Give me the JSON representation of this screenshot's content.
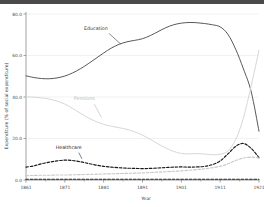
{
  "chart_data": {
    "type": "line",
    "title": "",
    "xlabel": "Year",
    "ylabel": "Expenditure (% of social expenditure)",
    "xlim": [
      1861,
      1921
    ],
    "ylim": [
      0.0,
      80.0
    ],
    "grid": true,
    "legend_position": "inline-annotations",
    "xticks": [
      "1861",
      "1871",
      "1881",
      "1891",
      "1901",
      "1911",
      "1921"
    ],
    "xtick_values": [
      1861,
      1871,
      1881,
      1891,
      1901,
      1911,
      1921
    ],
    "yticks": [
      "0.0",
      "20.0",
      "40.0",
      "60.0",
      "80.0"
    ],
    "ytick_values": [
      0.0,
      20.0,
      40.0,
      60.0,
      80.0
    ],
    "x": [
      1861,
      1863,
      1865,
      1867,
      1869,
      1871,
      1873,
      1875,
      1877,
      1879,
      1881,
      1883,
      1885,
      1887,
      1889,
      1891,
      1893,
      1895,
      1897,
      1899,
      1901,
      1903,
      1905,
      1907,
      1909,
      1911,
      1913,
      1915,
      1917,
      1919,
      1921
    ],
    "series": [
      {
        "name": "Education",
        "color": "#4f4f4f",
        "style": "solid",
        "label_x": 1879,
        "label_y": 72.5,
        "values": [
          50.2,
          49.4,
          48.9,
          48.8,
          49.2,
          50.1,
          51.6,
          53.6,
          56.0,
          58.6,
          61.2,
          63.6,
          65.4,
          66.6,
          67.3,
          68.1,
          69.6,
          71.5,
          73.4,
          74.8,
          75.6,
          75.9,
          75.8,
          75.4,
          74.8,
          73.8,
          70.2,
          63.0,
          53.5,
          42.5,
          23.5
        ]
      },
      {
        "name": "Pensions",
        "color": "#d4d4d4",
        "style": "solid",
        "label_x": 1876,
        "label_y": 38.5,
        "values": [
          40.1,
          39.9,
          39.6,
          39.0,
          38.0,
          36.6,
          34.5,
          32.2,
          30.0,
          28.2,
          26.8,
          25.9,
          25.2,
          24.4,
          23.2,
          21.6,
          19.6,
          17.4,
          15.4,
          13.8,
          12.8,
          12.6,
          12.7,
          12.5,
          12.2,
          12.4,
          14.0,
          19.5,
          30.0,
          45.5,
          62.5
        ]
      },
      {
        "name": "Healthcare",
        "color": "#1a1a1a",
        "style": "dashed",
        "label_x": 1872,
        "label_y": 15.0,
        "values": [
          6.2,
          6.8,
          7.8,
          8.6,
          9.2,
          9.6,
          9.4,
          8.8,
          8.0,
          7.2,
          6.6,
          6.2,
          5.9,
          5.7,
          5.6,
          5.5,
          5.6,
          5.8,
          6.0,
          6.2,
          6.3,
          6.2,
          6.3,
          6.6,
          7.4,
          9.2,
          12.6,
          16.2,
          17.6,
          15.2,
          10.8
        ]
      },
      {
        "name": "Other",
        "color": "#c9c9c9",
        "style": "dashed",
        "label_x": null,
        "label_y": null,
        "values": [
          2.1,
          2.2,
          2.3,
          2.3,
          2.4,
          2.4,
          2.5,
          2.6,
          2.7,
          2.8,
          2.9,
          3.0,
          3.1,
          3.2,
          3.3,
          3.4,
          3.6,
          3.8,
          4.0,
          4.2,
          4.4,
          4.7,
          5.0,
          5.4,
          5.9,
          6.6,
          7.8,
          9.4,
          10.6,
          11.0,
          10.6
        ]
      },
      {
        "name": "Baseline",
        "color": "#1f1f1f",
        "style": "dashed",
        "label_x": null,
        "label_y": null,
        "values": [
          0.35,
          0.35,
          0.35,
          0.35,
          0.35,
          0.35,
          0.35,
          0.35,
          0.35,
          0.35,
          0.35,
          0.35,
          0.35,
          0.35,
          0.35,
          0.35,
          0.35,
          0.35,
          0.35,
          0.35,
          0.35,
          0.35,
          0.35,
          0.35,
          0.35,
          0.35,
          0.35,
          0.35,
          0.35,
          0.35,
          0.35
        ]
      }
    ],
    "annotations": [
      {
        "text": "Education",
        "x": 1879,
        "y": 72.5,
        "color": "#3a3a3a",
        "leader": {
          "x1": 1882.4,
          "y1": 70.6,
          "x2": 1885.4,
          "y2": 65.5
        }
      },
      {
        "text": "Pensions",
        "x": 1876,
        "y": 38.5,
        "color": "#b8b8b8",
        "leader": {
          "x1": 1878.6,
          "y1": 36.6,
          "x2": 1880.4,
          "y2": 30.2
        }
      },
      {
        "text": "Healthcare",
        "x": 1872,
        "y": 15.0,
        "color": "#2b2b2b",
        "leader": {
          "x1": 1874.6,
          "y1": 13.2,
          "x2": 1875.4,
          "y2": 10.2
        }
      }
    ]
  },
  "figure": {
    "background": "#ffffff",
    "grid_color": "#eeeeee",
    "axis_color": "#8a8a8a",
    "tick_color": "#4d4d4d"
  }
}
